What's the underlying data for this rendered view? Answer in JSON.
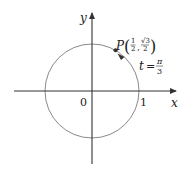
{
  "diagram": {
    "type": "unit-circle",
    "axes": {
      "x_label": "x",
      "y_label": "y",
      "origin_label": "0",
      "x_tick_label": "1"
    },
    "point": {
      "name": "P",
      "x_num": "1",
      "x_den": "2",
      "y_num": "√3",
      "y_den": "2"
    },
    "angle": {
      "var": "t",
      "eq": "=",
      "num": "π",
      "den": "3"
    },
    "colors": {
      "stroke": "#555555",
      "axis": "#333333",
      "circle": "#8a8a8a",
      "point": "#333333",
      "text": "#222222"
    }
  }
}
